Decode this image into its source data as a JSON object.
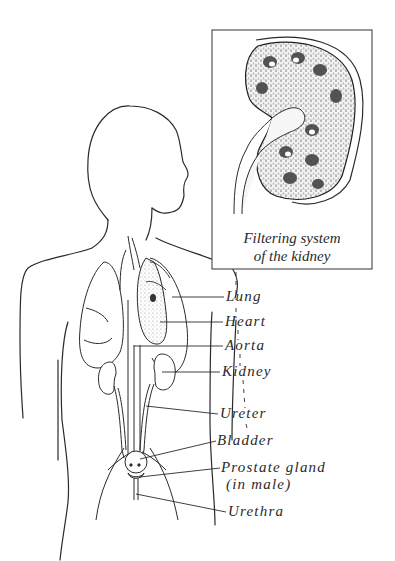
{
  "figure": {
    "inset": {
      "caption_line1": "Filtering system",
      "caption_line2": "of the kidney"
    },
    "labels": [
      {
        "id": "lung",
        "text": "Lung"
      },
      {
        "id": "heart",
        "text": "Heart"
      },
      {
        "id": "aorta",
        "text": "Aorta"
      },
      {
        "id": "kidney",
        "text": "Kidney"
      },
      {
        "id": "ureter",
        "text": "Ureter"
      },
      {
        "id": "bladder",
        "text": "Bladder"
      },
      {
        "id": "prostate",
        "text": "Prostate gland"
      },
      {
        "id": "prostate-note",
        "text": "(in male)"
      },
      {
        "id": "urethra",
        "text": "Urethra"
      }
    ],
    "colors": {
      "line": "#2a2a2a",
      "background": "#ffffff",
      "stipple": "#9a9a9a"
    }
  }
}
